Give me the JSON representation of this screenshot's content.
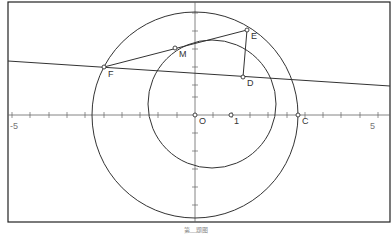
{
  "figure": {
    "type": "geometry-diagram",
    "caption": "第__题图",
    "colors": {
      "stroke": "#333333",
      "axis": "#666666",
      "frame": "#222222",
      "background": "#ffffff"
    },
    "axes": {
      "x_tick_labels": [
        "-5",
        "1",
        "5"
      ],
      "origin_label": "O",
      "x_range": [
        -5,
        5
      ],
      "tick_step": 0.5
    },
    "points": [
      {
        "name": "O",
        "label": "O",
        "x": 0,
        "y": 0
      },
      {
        "name": "one",
        "label": "1",
        "x": 1,
        "y": 0
      },
      {
        "name": "C",
        "label": "C",
        "x": 2.8,
        "y": 0
      },
      {
        "name": "D",
        "label": "D",
        "x": 1.3,
        "y": 1.1
      },
      {
        "name": "E",
        "label": "E",
        "x": 1.4,
        "y": 2.3
      },
      {
        "name": "F",
        "label": "F",
        "x": -2.4,
        "y": 1.3
      },
      {
        "name": "M",
        "label": "M",
        "x": -0.5,
        "y": 1.8
      }
    ],
    "circles": [
      {
        "name": "large-circle",
        "center": "O",
        "radius": 2.8
      },
      {
        "name": "small-circle",
        "center_approx": [
          0.45,
          0.3
        ],
        "radius_approx": 1.75
      }
    ],
    "lines": [
      {
        "name": "line-FD",
        "through": [
          "F",
          "D"
        ],
        "extended": true
      },
      {
        "name": "segment-FE",
        "from": "F",
        "to": "E"
      },
      {
        "name": "segment-ED",
        "from": "E",
        "to": "D"
      }
    ]
  }
}
